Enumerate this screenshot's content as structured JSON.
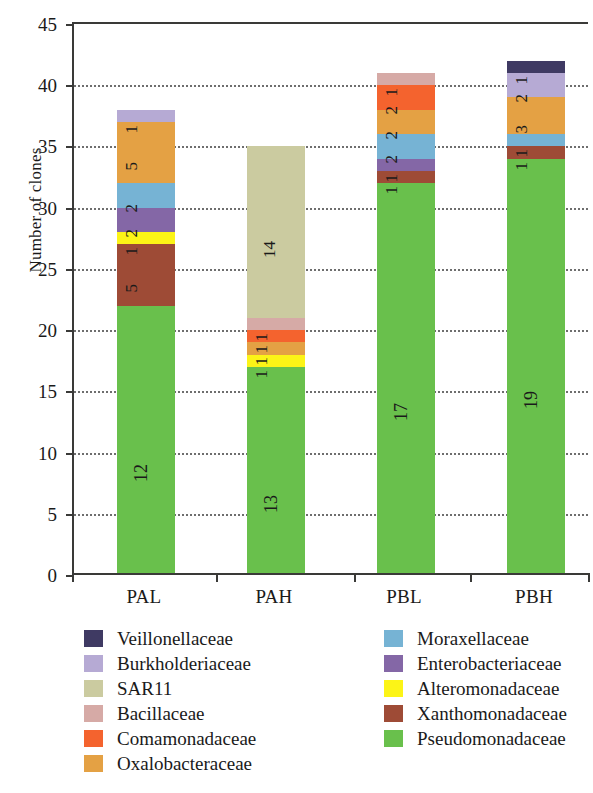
{
  "chart_data": {
    "type": "bar",
    "subtype": "stacked-bar",
    "title": "",
    "xlabel": "",
    "ylabel": "Number of clones",
    "ylim": [
      0,
      45
    ],
    "ytick_values": [
      0,
      5,
      10,
      15,
      20,
      25,
      30,
      35,
      40,
      45
    ],
    "ytick_labels": [
      "0",
      "5",
      "10",
      "15",
      "20",
      "25",
      "30",
      "35",
      "40",
      "45"
    ],
    "grid": "horizontal-dotted",
    "legend_position": "below-plot-two-columns",
    "categories": [
      "PAL",
      "PAH",
      "PBL",
      "PBH"
    ],
    "base_labels": [
      "12",
      "13",
      "17",
      "19"
    ],
    "series": [
      {
        "name": "Veillonellaceae",
        "color": "#3f3a63",
        "values": [
          0,
          0,
          0,
          1
        ]
      },
      {
        "name": "Burkholderiaceae",
        "color": "#b6aad4",
        "values": [
          1,
          0,
          0,
          2
        ]
      },
      {
        "name": "SAR11",
        "color": "#cbcba0",
        "values": [
          0,
          14,
          0,
          0
        ]
      },
      {
        "name": "Bacillaceae",
        "color": "#d6aaa6",
        "values": [
          0,
          1,
          1,
          0
        ]
      },
      {
        "name": "Comamonadaceae",
        "color": "#f4632e",
        "values": [
          0,
          1,
          2,
          0
        ]
      },
      {
        "name": "Oxalobacteraceae",
        "color": "#e4a144",
        "values": [
          5,
          1,
          2,
          3
        ]
      },
      {
        "name": "Moraxellaceae",
        "color": "#76b3d4",
        "values": [
          2,
          0,
          2,
          1
        ]
      },
      {
        "name": "Enterobacteriaceae",
        "color": "#8467a6",
        "values": [
          2,
          0,
          1,
          0
        ]
      },
      {
        "name": "Alteromonadaceae",
        "color": "#fcf417",
        "values": [
          1,
          1,
          0,
          0
        ]
      },
      {
        "name": "Xanthomonadaceae",
        "color": "#9e4b36",
        "values": [
          5,
          0,
          1,
          1
        ]
      },
      {
        "name": "Pseudomonadaceae",
        "color": "#69c04c",
        "values": [
          22,
          17,
          32,
          34
        ]
      }
    ],
    "bar_totals": [
      38,
      35,
      41,
      42
    ],
    "segment_annotations": {
      "PAL": [
        "12",
        "4",
        "12",
        "2",
        "4",
        "1"
      ],
      "PAH": [
        "13",
        "1",
        "1",
        "1",
        "19"
      ],
      "PBL": [
        "17",
        "1",
        "1",
        "1",
        "2",
        "2",
        "1"
      ],
      "PBH": [
        "19",
        "1",
        "1",
        "3",
        "2",
        "1"
      ]
    }
  },
  "legend": {
    "left_column": [
      {
        "label": "Veillonellaceae",
        "color": "#3f3a63"
      },
      {
        "label": "Burkholderiaceae",
        "color": "#b6aad4"
      },
      {
        "label": "SAR11",
        "color": "#cbcba0"
      },
      {
        "label": "Bacillaceae",
        "color": "#d6aaa6"
      },
      {
        "label": "Comamonadaceae",
        "color": "#f4632e"
      },
      {
        "label": "Oxalobacteraceae",
        "color": "#e4a144"
      }
    ],
    "right_column": [
      {
        "label": "Moraxellaceae",
        "color": "#76b3d4"
      },
      {
        "label": "Enterobacteriaceae",
        "color": "#8467a6"
      },
      {
        "label": "Alteromonadaceae",
        "color": "#fcf417"
      },
      {
        "label": "Xanthomonadaceae",
        "color": "#9e4b36"
      },
      {
        "label": "Pseudomonadaceae",
        "color": "#69c04c"
      }
    ]
  }
}
